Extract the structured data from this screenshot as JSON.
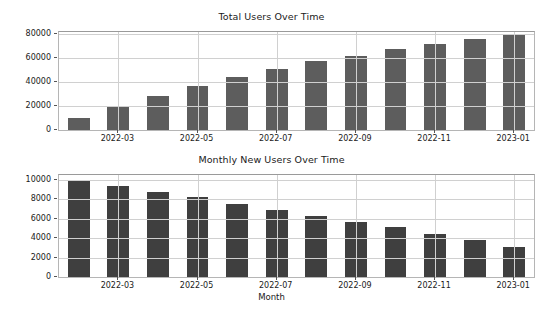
{
  "figure": {
    "width": 543,
    "height": 312,
    "background": "#ffffff"
  },
  "chart_data": [
    {
      "type": "bar",
      "title": "Total Users Over Time",
      "xlabel": "",
      "ylabel": "",
      "categories": [
        "2022-02",
        "2022-03",
        "2022-04",
        "2022-05",
        "2022-06",
        "2022-07",
        "2022-08",
        "2022-09",
        "2022-10",
        "2022-11",
        "2022-12",
        "2023-01"
      ],
      "values": [
        10000,
        19900,
        28700,
        36800,
        44300,
        51200,
        57500,
        62300,
        67800,
        72300,
        76100,
        79200
      ],
      "ylim": [
        0,
        82000
      ],
      "yticks": [
        0,
        20000,
        40000,
        60000,
        80000
      ],
      "ytick_labels": [
        "0",
        "20000",
        "40000",
        "60000",
        "80000"
      ],
      "xticks": [
        "2022-03",
        "2022-05",
        "2022-07",
        "2022-09",
        "2022-11",
        "2023-01"
      ],
      "xtick_indices": [
        1,
        3,
        5,
        7,
        9,
        11
      ],
      "grid": true,
      "legend": null,
      "bar_color": "#5d5d5d"
    },
    {
      "type": "bar",
      "title": "Monthly New Users Over Time",
      "xlabel": "Month",
      "ylabel": "",
      "categories": [
        "2022-02",
        "2022-03",
        "2022-04",
        "2022-05",
        "2022-06",
        "2022-07",
        "2022-08",
        "2022-09",
        "2022-10",
        "2022-11",
        "2022-12",
        "2023-01"
      ],
      "values": [
        10000,
        9400,
        8800,
        8200,
        7500,
        6900,
        6300,
        5700,
        5100,
        4400,
        3800,
        3100
      ],
      "ylim": [
        0,
        10500
      ],
      "yticks": [
        0,
        2000,
        4000,
        6000,
        8000,
        10000
      ],
      "ytick_labels": [
        "0",
        "2000",
        "4000",
        "6000",
        "8000",
        "10000"
      ],
      "xticks": [
        "2022-03",
        "2022-05",
        "2022-07",
        "2022-09",
        "2022-11",
        "2023-01"
      ],
      "xtick_indices": [
        1,
        3,
        5,
        7,
        9,
        11
      ],
      "grid": true,
      "legend": null,
      "bar_color": "#3f3f3f"
    }
  ]
}
